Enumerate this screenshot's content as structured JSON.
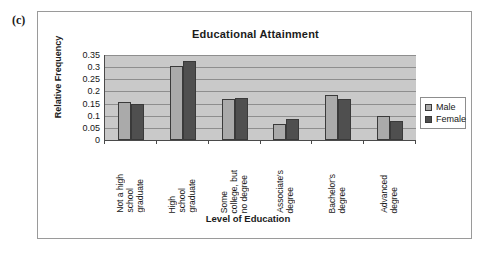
{
  "panel": {
    "label": "(c)"
  },
  "chart_data": {
    "type": "bar",
    "title": "Educational Attainment",
    "xlabel": "Level of Education",
    "ylabel": "Relative Frequency",
    "ylim": [
      0,
      0.35
    ],
    "grid": true,
    "legend_position": "right",
    "ytick_labels": [
      "0.35",
      "0.3",
      "0.25",
      "0.2",
      "0.15",
      "0.1",
      "0.05",
      "0"
    ],
    "ytick_values": [
      0.35,
      0.3,
      0.25,
      0.2,
      0.15,
      0.1,
      0.05,
      0
    ],
    "categories": [
      "Not a high school graduate",
      "High school graduate",
      "Some college, but no degree",
      "Associate's degree",
      "Bachelor's degree",
      "Advanced degree"
    ],
    "category_lines": [
      [
        "Not a high",
        "school",
        "graduate"
      ],
      [
        "High",
        "school",
        "graduate"
      ],
      [
        "Some",
        "college, but",
        "no degree"
      ],
      [
        "Associate's",
        "degree"
      ],
      [
        "Bachelor's",
        "degree"
      ],
      [
        "Advanced",
        "degree"
      ]
    ],
    "series": [
      {
        "name": "Male",
        "color": "#aaaaaa",
        "values": [
          0.157,
          0.305,
          0.17,
          0.065,
          0.185,
          0.099
        ]
      },
      {
        "name": "Female",
        "color": "#4f4f4f",
        "values": [
          0.148,
          0.325,
          0.171,
          0.088,
          0.168,
          0.079
        ]
      }
    ]
  },
  "legend": {
    "items": [
      {
        "label": "Male",
        "swatch": "male"
      },
      {
        "label": "Female",
        "swatch": "female"
      }
    ]
  },
  "colors": {
    "male_bar": "#aaaaaa",
    "female_bar": "#4f4f4f",
    "plot_background": "#c9c9c9",
    "gridline": "#8e8e8e",
    "axis": "#4a4a4a",
    "frame_border": "#9a9a9a",
    "text": "#161616"
  }
}
